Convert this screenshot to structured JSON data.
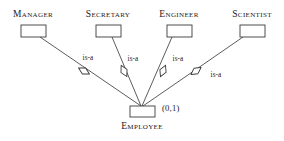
{
  "diagram": {
    "type": "er-diagram",
    "background_color": "#ffffff",
    "line_color": "#4a4a4a",
    "text_color": "#1a1a1a",
    "superclass": {
      "label": "Employee",
      "cardinality": "(0,1)",
      "box": {
        "x": 130,
        "y": 106,
        "w": 25,
        "h": 11
      },
      "label_pos": {
        "x": 142,
        "y": 122
      },
      "cardinality_pos": {
        "x": 162,
        "y": 104
      }
    },
    "subclasses": [
      {
        "label": "Manager",
        "box": {
          "x": 21,
          "y": 25,
          "w": 25,
          "h": 12
        },
        "label_pos": {
          "x": 33,
          "y": 10
        },
        "relationship": "is-a",
        "rel_label_pos": {
          "x": 88,
          "y": 55
        },
        "diamond": {
          "cx": 84,
          "cy": 71,
          "rx": 6.2,
          "ry": 3.4,
          "angle": 29
        },
        "line": {
          "x1": 40,
          "y1": 37,
          "x2": 141,
          "y2": 106
        }
      },
      {
        "label": "Secretary",
        "box": {
          "x": 96,
          "y": 25,
          "w": 25,
          "h": 12
        },
        "label_pos": {
          "x": 108,
          "y": 10
        },
        "relationship": "is-a",
        "rel_label_pos": {
          "x": 133,
          "y": 56
        },
        "diamond": {
          "cx": 124,
          "cy": 71,
          "rx": 6.2,
          "ry": 3.4,
          "angle": 63
        },
        "line": {
          "x1": 112,
          "y1": 37,
          "x2": 141,
          "y2": 106
        }
      },
      {
        "label": "Engineer",
        "box": {
          "x": 167,
          "y": 25,
          "w": 25,
          "h": 12
        },
        "label_pos": {
          "x": 179,
          "y": 10
        },
        "relationship": "is-a",
        "rel_label_pos": {
          "x": 178,
          "y": 56
        },
        "diamond": {
          "cx": 163,
          "cy": 71,
          "rx": 6.2,
          "ry": 3.4,
          "angle": 114
        },
        "line": {
          "x1": 172,
          "y1": 37,
          "x2": 142,
          "y2": 106
        }
      },
      {
        "label": "Scientist",
        "box": {
          "x": 240,
          "y": 25,
          "w": 25,
          "h": 12
        },
        "label_pos": {
          "x": 252,
          "y": 10
        },
        "relationship": "is-a",
        "rel_label_pos": {
          "x": 216,
          "y": 72
        },
        "diamond": {
          "cx": 196,
          "cy": 71,
          "rx": 6.2,
          "ry": 3.4,
          "angle": 145
        },
        "line": {
          "x1": 243,
          "y1": 37,
          "x2": 143,
          "y2": 106
        }
      }
    ]
  }
}
